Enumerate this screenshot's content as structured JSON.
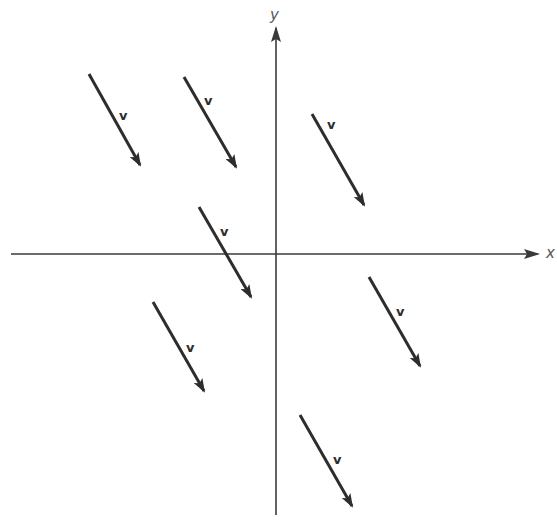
{
  "diagram": {
    "title": "",
    "colors": {
      "ink": "#2d2d2d",
      "axis": "#3a3a3a",
      "background": "#ffffff"
    },
    "axes": {
      "origin": [
        276,
        254
      ],
      "x_axis": {
        "label": "x",
        "from": [
          11,
          254
        ],
        "to": [
          538,
          254
        ],
        "label_pos": [
          546,
          258
        ]
      },
      "y_axis": {
        "label": "y",
        "from": [
          276,
          515
        ],
        "to": [
          276,
          28
        ],
        "label_pos": [
          270,
          20
        ]
      }
    },
    "vectors": [
      {
        "label": "v",
        "start": [
          89,
          74
        ],
        "end": [
          140,
          165
        ],
        "label_pos": [
          119,
          120
        ]
      },
      {
        "label": "v",
        "start": [
          184,
          77
        ],
        "end": [
          236,
          167
        ],
        "label_pos": [
          204,
          105
        ]
      },
      {
        "label": "v",
        "start": [
          312,
          114
        ],
        "end": [
          364,
          205
        ],
        "label_pos": [
          327,
          129
        ]
      },
      {
        "label": "v",
        "start": [
          199,
          207
        ],
        "end": [
          251,
          297
        ],
        "label_pos": [
          220,
          236
        ]
      },
      {
        "label": "v",
        "start": [
          153,
          302
        ],
        "end": [
          204,
          391
        ],
        "label_pos": [
          186,
          352
        ]
      },
      {
        "label": "v",
        "start": [
          369,
          277
        ],
        "end": [
          420,
          366
        ],
        "label_pos": [
          396,
          316
        ]
      },
      {
        "label": "v",
        "start": [
          300,
          415
        ],
        "end": [
          352,
          506
        ],
        "label_pos": [
          333,
          464
        ]
      }
    ]
  }
}
